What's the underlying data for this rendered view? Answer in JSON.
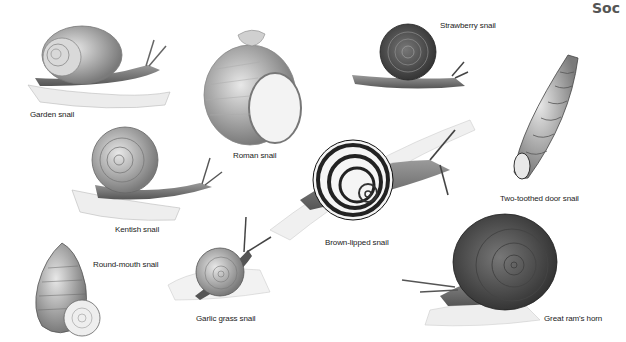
{
  "page": {
    "corner_text": "Soc"
  },
  "snails": [
    {
      "name": "Garden snail",
      "label_x": 30,
      "label_y": 110
    },
    {
      "name": "Roman snail",
      "label_x": 233,
      "label_y": 151
    },
    {
      "name": "Strawberry snail",
      "label_x": 440,
      "label_y": 21
    },
    {
      "name": "Two-toothed door snail",
      "label_x": 500,
      "label_y": 194
    },
    {
      "name": "Kentish snail",
      "label_x": 115,
      "label_y": 225
    },
    {
      "name": "Brown-lipped snail",
      "label_x": 325,
      "label_y": 238
    },
    {
      "name": "Round-mouth snail",
      "label_x": 93,
      "label_y": 260
    },
    {
      "name": "Garlic grass snail",
      "label_x": 196,
      "label_y": 314
    },
    {
      "name": "Great ram's horn",
      "label_x": 544,
      "label_y": 314
    }
  ],
  "colors": {
    "background": "#ffffff",
    "ink": "#222222",
    "shell_mid": "#8a8a8a",
    "shell_dark": "#3a3a3a"
  }
}
